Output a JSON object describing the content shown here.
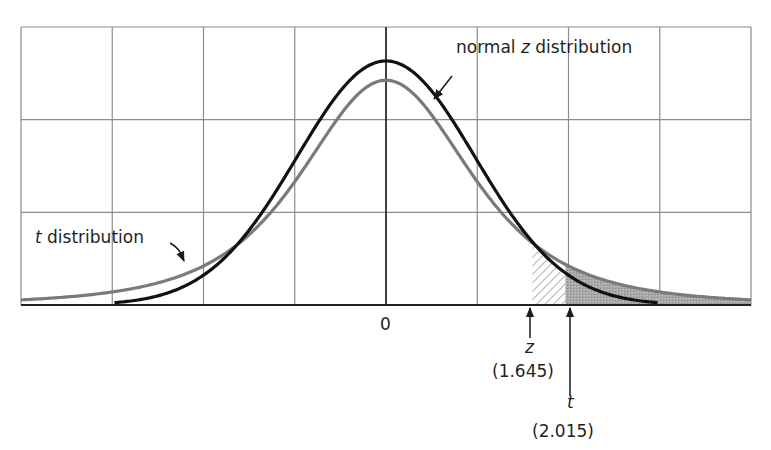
{
  "chart_data": {
    "type": "line",
    "title": "",
    "xlabel": "",
    "ylabel": "",
    "x_range": [
      -4.1,
      4.1
    ],
    "grid": true,
    "grid_columns": 8,
    "grid_rows": 3,
    "series": [
      {
        "name": "normal z distribution",
        "distribution": "normal",
        "mean": 0,
        "sd": 1,
        "peak_density": 0.399,
        "color": "#111111",
        "width": 3.2
      },
      {
        "name": "t distribution",
        "distribution": "t",
        "df": 3,
        "peak_density": 0.368,
        "color": "#7a7a7a",
        "width": 3.2
      }
    ],
    "tick_labels": [
      {
        "x": 0,
        "label": "0"
      }
    ],
    "critical_values": [
      {
        "name": "z",
        "value": 1.645,
        "label": "(1.645)",
        "region": "hatched",
        "region_to": 2.015
      },
      {
        "name": "t",
        "value": 2.015,
        "label": "(2.015)",
        "region": "shaded"
      }
    ],
    "annotations": [
      {
        "text_prefix": "normal ",
        "text_italic": "z",
        "text_suffix": " distribution",
        "points_to": "normal z distribution"
      },
      {
        "text_italic": "t",
        "text_suffix": " distribution",
        "points_to": "t distribution"
      }
    ]
  },
  "labels": {
    "zero": "0",
    "normal_prefix": "normal ",
    "normal_italic": "z",
    "normal_suffix": " distribution",
    "t_dist_italic": "t",
    "t_dist_suffix": " distribution",
    "z_symbol": "z",
    "z_value": "(1.645)",
    "t_symbol": "t",
    "t_value": "(2.015)"
  }
}
